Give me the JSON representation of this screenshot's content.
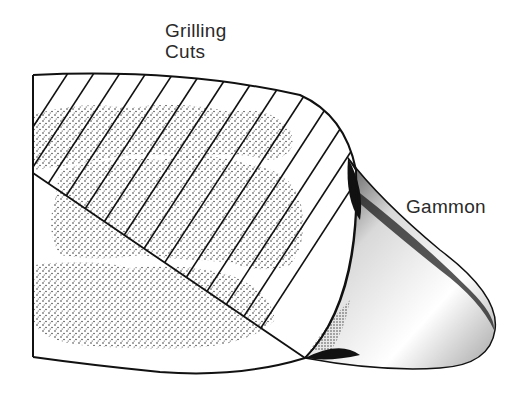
{
  "diagram": {
    "labels": [
      {
        "id": "grilling-cuts",
        "lines": [
          "Grilling",
          "Cuts"
        ]
      },
      {
        "id": "gammon",
        "lines": [
          "Gammon"
        ]
      }
    ],
    "colors": {
      "ink": "#111111",
      "label": "#2a2a2a",
      "background": "#ffffff"
    }
  }
}
